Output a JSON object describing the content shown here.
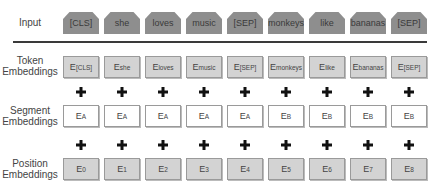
{
  "rows": {
    "input": {
      "label": "Input",
      "tokens": [
        "[CLS]",
        "she",
        "loves",
        "music",
        "[SEP]",
        "monkeys",
        "like",
        "bananas",
        "[SEP]"
      ]
    },
    "token": {
      "label_line1": "Token",
      "label_line2": "Embeddings",
      "cells": [
        {
          "base": "E",
          "sub": "[CLS]"
        },
        {
          "base": "E",
          "sub": "she"
        },
        {
          "base": "E",
          "sub": "loves"
        },
        {
          "base": "E",
          "sub": "music"
        },
        {
          "base": "E",
          "sub": "[SEP]"
        },
        {
          "base": "E",
          "sub": "monkeys"
        },
        {
          "base": "E",
          "sub": "like"
        },
        {
          "base": "E",
          "sub": "bananas"
        },
        {
          "base": "E",
          "sub": "[SEP]"
        }
      ]
    },
    "segment": {
      "label_line1": "Segment",
      "label_line2": "Embeddings",
      "cells": [
        {
          "base": "E",
          "sub": "A"
        },
        {
          "base": "E",
          "sub": "A"
        },
        {
          "base": "E",
          "sub": "A"
        },
        {
          "base": "E",
          "sub": "A"
        },
        {
          "base": "E",
          "sub": "A"
        },
        {
          "base": "E",
          "sub": "B"
        },
        {
          "base": "E",
          "sub": "B"
        },
        {
          "base": "E",
          "sub": "B"
        },
        {
          "base": "E",
          "sub": "B"
        }
      ]
    },
    "position": {
      "label_line1": "Position",
      "label_line2": "Embeddings",
      "cells": [
        {
          "base": "E",
          "sub": "0"
        },
        {
          "base": "E",
          "sub": "1"
        },
        {
          "base": "E",
          "sub": "2"
        },
        {
          "base": "E",
          "sub": "3"
        },
        {
          "base": "E",
          "sub": "4"
        },
        {
          "base": "E",
          "sub": "5"
        },
        {
          "base": "E",
          "sub": "6"
        },
        {
          "base": "E",
          "sub": "7"
        },
        {
          "base": "E",
          "sub": "8"
        }
      ]
    }
  },
  "operator_symbol": "plus-icon",
  "colors": {
    "input_fill": "#8e8e8e",
    "token_fill": "#d3d3d3",
    "segment_fill": "#ffffff",
    "position_fill": "#d3d3d3",
    "border": "#9a9a9a",
    "divider": "#3a3a3a"
  }
}
